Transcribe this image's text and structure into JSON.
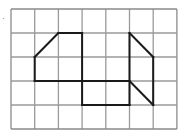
{
  "figure": {
    "marker": "·",
    "grid": {
      "columns": 7,
      "rows": 5,
      "origin_x": 11,
      "origin_y": 9,
      "cell_w": 23.7,
      "cell_h": 24,
      "line_color": "#9a9a9a",
      "border_color": "#8a8a8a"
    },
    "shape": {
      "stroke_color": "#1a1a1a",
      "segments": [
        [
          [
            1,
            2
          ],
          [
            2,
            1
          ]
        ],
        [
          [
            2,
            1
          ],
          [
            3,
            1
          ]
        ],
        [
          [
            1,
            2
          ],
          [
            1,
            3
          ]
        ],
        [
          [
            1,
            3
          ],
          [
            5,
            3
          ]
        ],
        [
          [
            3,
            1
          ],
          [
            3,
            4
          ]
        ],
        [
          [
            3,
            4
          ],
          [
            5,
            4
          ]
        ],
        [
          [
            5,
            1
          ],
          [
            5,
            4
          ]
        ],
        [
          [
            5,
            1
          ],
          [
            6,
            2
          ]
        ],
        [
          [
            6,
            2
          ],
          [
            6,
            4
          ]
        ],
        [
          [
            5,
            3
          ],
          [
            6,
            4
          ]
        ]
      ]
    }
  }
}
